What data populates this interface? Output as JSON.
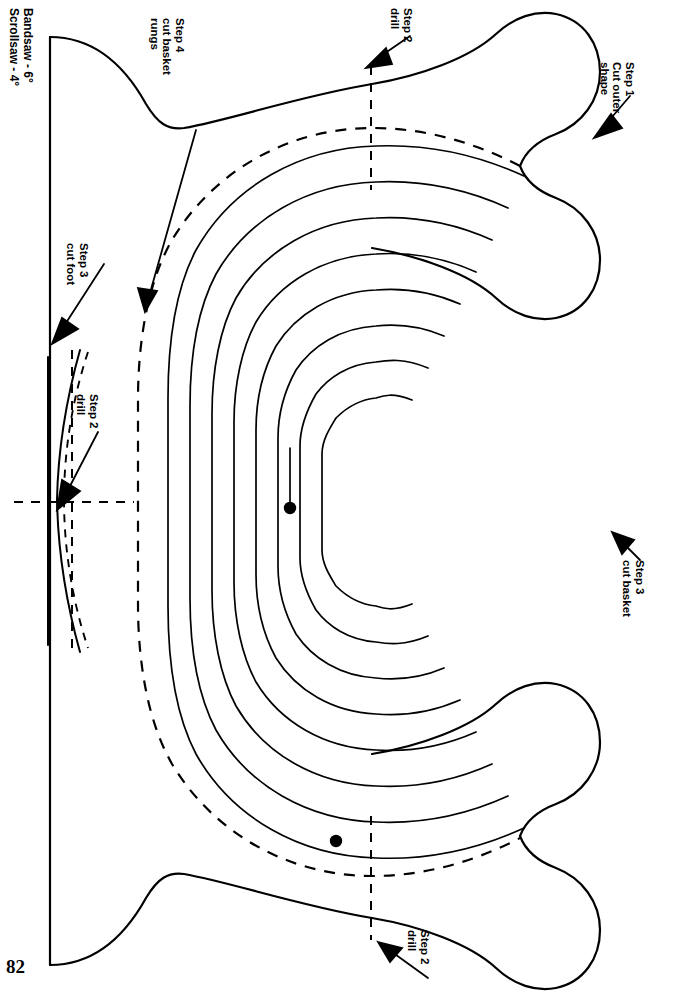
{
  "page": {
    "number": "82",
    "width": 673,
    "height": 1004,
    "background_color": "#ffffff",
    "ink_color": "#000000",
    "orientation_note": "labels rotated 90 degrees clockwise"
  },
  "saw_settings": {
    "line_1": "Bandsaw - 6°",
    "line_2": "Scrollsaw - 4°"
  },
  "annotations": [
    {
      "id": "step-4-cut-basket-rungs",
      "lines": [
        "Step 4",
        "cut basket",
        "rungs"
      ],
      "text": "Step 4\ncut basket\nrungs",
      "label_x": 186,
      "label_y": 18,
      "leader": {
        "x1": 196,
        "y1": 130,
        "x2": 146,
        "y2": 303
      },
      "arrow_head": {
        "x": 145,
        "y": 306,
        "angle_deg": 105
      }
    },
    {
      "id": "step-2-drill-top",
      "lines": [
        "Step 2",
        "drill"
      ],
      "text": "Step 2\ndrill",
      "label_x": 414,
      "label_y": 8,
      "leader": {
        "x1": 406,
        "y1": 34,
        "x2": 374,
        "y2": 60
      },
      "arrow_head": {
        "x": 370,
        "y": 64,
        "angle_deg": 140
      }
    },
    {
      "id": "step-1-cut-outer-shape",
      "lines": [
        "Step 1",
        "Cut outer",
        "shape"
      ],
      "text": "Step 1\nCut outer\nshape",
      "label_x": 636,
      "label_y": 62,
      "leader": {
        "x1": 627,
        "y1": 96,
        "x2": 601,
        "y2": 128
      },
      "arrow_head": {
        "x": 596,
        "y": 133,
        "angle_deg": 133
      }
    },
    {
      "id": "step-3-cut-foot",
      "lines": [
        "Step 3",
        "cut foot"
      ],
      "text": "Step 3\ncut foot",
      "label_x": 90,
      "label_y": 243,
      "leader": {
        "x1": 82,
        "y1": 275,
        "x2": 58,
        "y2": 330
      },
      "arrow_head": {
        "x": 54,
        "y": 336,
        "angle_deg": 113
      }
    },
    {
      "id": "step-2-drill-foot",
      "lines": [
        "Step 2",
        "drill"
      ],
      "text": "Step 2\ndrill",
      "label_x": 100,
      "label_y": 394,
      "leader": {
        "x1": 92,
        "y1": 430,
        "x2": 64,
        "y2": 490
      },
      "arrow_head": {
        "x": 59,
        "y": 498,
        "angle_deg": 115
      }
    },
    {
      "id": "step-3-cut-basket",
      "lines": [
        "Step 3",
        "cut basket"
      ],
      "text": "Step 3\ncut basket",
      "label_x": 646,
      "label_y": 560,
      "leader": {
        "x1": 638,
        "y1": 556,
        "x2": 620,
        "y2": 540
      },
      "arrow_head": {
        "x": 615,
        "y": 536,
        "angle_deg": -42
      }
    },
    {
      "id": "step-2-drill-bottom",
      "lines": [
        "Step 2",
        "drill"
      ],
      "text": "Step 2\ndrill",
      "label_x": 431,
      "label_y": 952,
      "leader": {
        "x1": 423,
        "y1": 980,
        "x2": 385,
        "y2": 950
      },
      "arrow_head": {
        "x": 380,
        "y": 946,
        "angle_deg": -142
      }
    }
  ],
  "drawing": {
    "outer_shape": {
      "name": "Step 1 outer silhouette",
      "style": "solid",
      "stroke_width": 2.2
    },
    "cut_basket_guide": {
      "name": "Step 3 dashed basket cut line",
      "style": "dashed",
      "stroke_width": 2.2,
      "dash": "11 9"
    },
    "basket_rungs": {
      "name": "Step 4 concentric basket rungs",
      "style": "solid",
      "count": 8,
      "stroke_width": 1.7
    },
    "foot_outline": {
      "name": "Step 3 dashed foot outline",
      "style": "dashed",
      "stroke_width": 1.9,
      "dash": "8 7"
    },
    "center_lines": {
      "name": "drill centerlines",
      "style": "dashed",
      "stroke_width": 2.0,
      "dash": "9 8"
    },
    "drill_points": [
      {
        "id": "drill-point-inner",
        "x": 290,
        "y": 508,
        "r": 6
      },
      {
        "id": "drill-point-outer",
        "x": 336,
        "y": 841,
        "r": 6
      }
    ]
  }
}
